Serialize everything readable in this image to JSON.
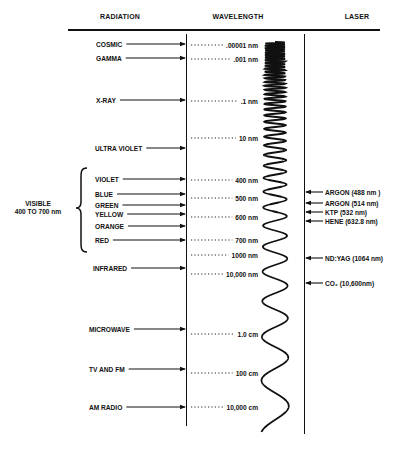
{
  "headers": {
    "radiation": "RADIATION",
    "wavelength": "WAVELENGTH",
    "laser": "LASER"
  },
  "visible_group": {
    "line1": "VISIBLE",
    "line2": "400 TO 700 nm"
  },
  "radiation": [
    {
      "label": "COSMIC",
      "y": 44
    },
    {
      "label": "GAMMA",
      "y": 58
    },
    {
      "label": "X-RAY",
      "y": 100
    },
    {
      "label": "ULTRA VIOLET",
      "y": 148
    },
    {
      "label": "VIOLET",
      "y": 179
    },
    {
      "label": "BLUE",
      "y": 194
    },
    {
      "label": "GREEN",
      "y": 205
    },
    {
      "label": "YELLOW",
      "y": 214
    },
    {
      "label": "ORANGE",
      "y": 226
    },
    {
      "label": "RED",
      "y": 240
    },
    {
      "label": "INFRARED",
      "y": 268
    },
    {
      "label": "MICROWAVE",
      "y": 329
    },
    {
      "label": "TV AND FM",
      "y": 369
    },
    {
      "label": "AM RADIO",
      "y": 407
    }
  ],
  "wavelengths": [
    {
      "label": ".00001 nm",
      "y": 45
    },
    {
      "label": ".001 nm",
      "y": 59
    },
    {
      "label": ".1 nm",
      "y": 101
    },
    {
      "label": "10 nm",
      "y": 138
    },
    {
      "label": "400 nm",
      "y": 180
    },
    {
      "label": "500 nm",
      "y": 198
    },
    {
      "label": "600 nm",
      "y": 217
    },
    {
      "label": "700 nm",
      "y": 240
    },
    {
      "label": "1000 nm",
      "y": 255
    },
    {
      "label": "10,000 nm",
      "y": 274
    },
    {
      "label": "1.0 cm",
      "y": 334
    },
    {
      "label": "100 cm",
      "y": 373
    },
    {
      "label": "10,000 cm",
      "y": 407
    }
  ],
  "lasers": [
    {
      "label": "ARGON (488 nm )",
      "y": 192
    },
    {
      "label": "ARGON (514 nm)",
      "y": 203
    },
    {
      "label": "KTP (532 nm)",
      "y": 212
    },
    {
      "label": "HENE (632.8 nm)",
      "y": 221
    },
    {
      "label": "ND:YAG (1064 nm)",
      "y": 258
    },
    {
      "label": "CO₂ (10,600nm)",
      "y": 283
    }
  ],
  "colors": {
    "ink": "#111111",
    "background": "#ffffff"
  }
}
